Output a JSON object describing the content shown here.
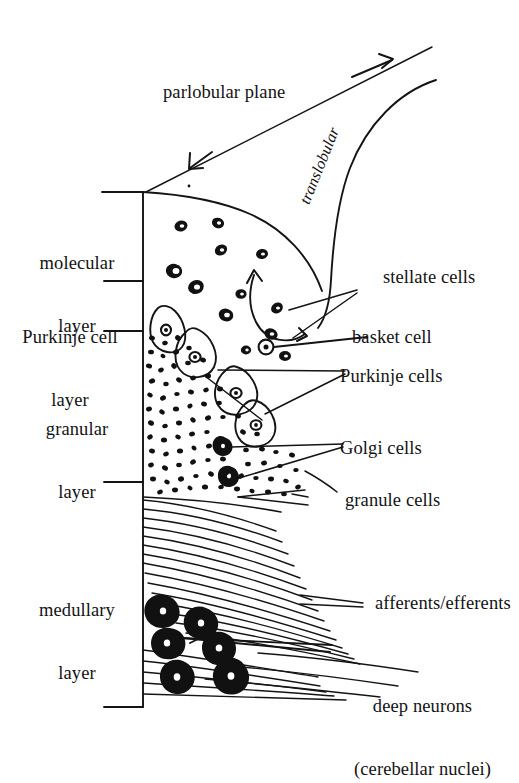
{
  "diagram": {
    "background_color": "#ffffff",
    "ink_color": "#111111"
  },
  "planes": {
    "parlobular": "parlobular plane",
    "translobular": "translobular"
  },
  "layers": [
    {
      "id": "molecular",
      "line1": "molecular",
      "line2": "layer"
    },
    {
      "id": "purkinje-cell",
      "line1": "Purkinje cell",
      "line2": "layer"
    },
    {
      "id": "granular",
      "line1": "granular",
      "line2": "layer"
    },
    {
      "id": "medullary",
      "line1": "medullary",
      "line2": "layer"
    }
  ],
  "cell_labels": [
    {
      "id": "stellate-cells",
      "line1": "stellate cells",
      "line2": ""
    },
    {
      "id": "basket-cell",
      "line1": "basket cell",
      "line2": ""
    },
    {
      "id": "purkinje-cells",
      "line1": "Purkinje cells",
      "line2": ""
    },
    {
      "id": "golgi-cells",
      "line1": "Golgi cells",
      "line2": ""
    },
    {
      "id": "granule-cells",
      "line1": "granule cells",
      "line2": ""
    },
    {
      "id": "afferents-efferents",
      "line1": "afferents/efferents",
      "line2": ""
    },
    {
      "id": "deep-neurons",
      "line1": "deep neurons",
      "line2": "(cerebellar nuclei)"
    }
  ]
}
